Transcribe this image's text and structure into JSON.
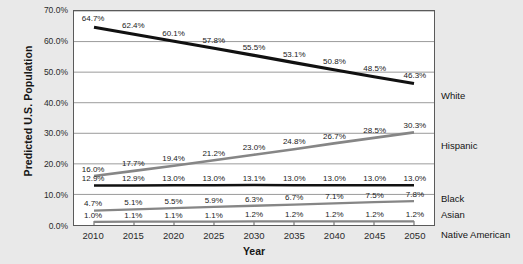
{
  "chart_data": {
    "type": "line",
    "title": "",
    "xlabel": "Year",
    "ylabel": "Predicted U.S. Population",
    "categories": [
      "2010",
      "2015",
      "2020",
      "2025",
      "2030",
      "2035",
      "2040",
      "2045",
      "2050"
    ],
    "x": [
      2010,
      2015,
      2020,
      2025,
      2030,
      2035,
      2040,
      2045,
      2050
    ],
    "ylim": [
      0,
      70
    ],
    "yticks": [
      "0.0%",
      "10.0%",
      "20.0%",
      "30.0%",
      "40.0%",
      "50.0%",
      "60.0%",
      "70.0%"
    ],
    "ytick_values": [
      0,
      10,
      20,
      30,
      40,
      50,
      60,
      70
    ],
    "grid": true,
    "legend_position": "right-of-plot-at-series-end",
    "series": [
      {
        "name": "White",
        "color": "#111111",
        "values": [
          64.7,
          62.4,
          60.1,
          57.8,
          55.5,
          53.1,
          50.8,
          48.5,
          46.3
        ],
        "labels": [
          "64.7%",
          "62.4%",
          "60.1%",
          "57.8%",
          "55.5%",
          "53.1%",
          "50.8%",
          "48.5%",
          "46.3%"
        ]
      },
      {
        "name": "Hispanic",
        "color": "#868686",
        "values": [
          16.0,
          17.7,
          19.4,
          21.2,
          23.0,
          24.8,
          26.7,
          28.5,
          30.3
        ],
        "labels": [
          "16.0%",
          "17.7%",
          "19.4%",
          "21.2%",
          "23.0%",
          "24.8%",
          "26.7%",
          "28.5%",
          "30.3%"
        ]
      },
      {
        "name": "Black",
        "color": "#111111",
        "values": [
          12.9,
          12.9,
          13.0,
          13.0,
          13.1,
          13.0,
          13.0,
          13.0,
          13.0
        ],
        "labels": [
          "12.9%",
          "12.9%",
          "13.0%",
          "13.0%",
          "13.1%",
          "13.0%",
          "13.0%",
          "13.0%",
          "13.0%"
        ]
      },
      {
        "name": "Asian",
        "color": "#868686",
        "values": [
          4.7,
          5.1,
          5.5,
          5.9,
          6.3,
          6.7,
          7.1,
          7.5,
          7.8
        ],
        "labels": [
          "4.7%",
          "5.1%",
          "5.5%",
          "5.9%",
          "6.3%",
          "6.7%",
          "7.1%",
          "7.5%",
          "7.8%"
        ]
      },
      {
        "name": "Native American",
        "color": "#868686",
        "values": [
          1.0,
          1.1,
          1.1,
          1.1,
          1.2,
          1.2,
          1.2,
          1.2,
          1.2
        ],
        "labels": [
          "1.0%",
          "1.1%",
          "1.1%",
          "1.1%",
          "1.2%",
          "1.2%",
          "1.2%",
          "1.2%",
          "1.2%"
        ]
      }
    ],
    "legend_entries": [
      "White",
      "Hispanic",
      "Black",
      "Asian",
      "Native American"
    ],
    "legend_y_anchor": [
      46.3,
      30.3,
      13.0,
      7.8,
      1.2
    ],
    "colors": {
      "background": "#e9e9e9",
      "plot_background": "#ffffff",
      "plot_border": "#5a5a5a",
      "gridline": "#8f8f8f",
      "dark_series": "#111111",
      "gray_series": "#868686",
      "text": "#1a1a1a"
    }
  }
}
